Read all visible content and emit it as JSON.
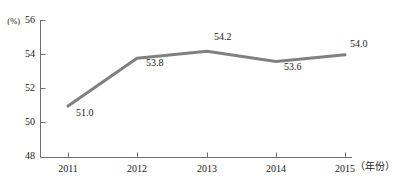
{
  "chart_data": {
    "type": "line",
    "title": "",
    "subtitle": "",
    "xlabel": "（年份）",
    "ylabel": "(%)",
    "categories": [
      "2011",
      "2012",
      "2013",
      "2014",
      "2015"
    ],
    "values": [
      51.0,
      53.8,
      54.2,
      53.6,
      54.0
    ],
    "point_labels": [
      "51.0",
      "53.8",
      "54.2",
      "53.6",
      "54.0"
    ],
    "series": [
      {
        "name": "",
        "values": [
          51.0,
          53.8,
          54.2,
          53.6,
          54.0
        ],
        "color": "#808080"
      }
    ],
    "ylim": [
      48,
      56
    ],
    "ytick_labels": [
      "56",
      "54",
      "52",
      "50",
      "48"
    ],
    "ytick_values": [
      56,
      54,
      52,
      50,
      48
    ],
    "xtick_labels": [
      "2011",
      "2012",
      "2013",
      "2014",
      "2015"
    ],
    "grid": false,
    "legend": false,
    "legend_position": "none",
    "axis_color": "#6e6e6e",
    "line_color": "#808080",
    "line_width": 3,
    "text_color": "#1a1a1a",
    "background": "#ffffff",
    "tick_direction": "in"
  },
  "axes": {
    "y_unit_label": "(%)",
    "x_unit_label": "（年份）",
    "y_ticks": [
      {
        "label": "56",
        "value": 56
      },
      {
        "label": "54",
        "value": 54
      },
      {
        "label": "52",
        "value": 52
      },
      {
        "label": "50",
        "value": 50
      },
      {
        "label": "48",
        "value": 48
      }
    ],
    "x_ticks": [
      {
        "label": "2011",
        "value": 2011
      },
      {
        "label": "2012",
        "value": 2012
      },
      {
        "label": "2013",
        "value": 2013
      },
      {
        "label": "2014",
        "value": 2014
      },
      {
        "label": "2015",
        "value": 2015
      }
    ]
  },
  "data_labels": [
    {
      "text": "51.0",
      "year": "2011"
    },
    {
      "text": "53.8",
      "year": "2012"
    },
    {
      "text": "54.2",
      "year": "2013"
    },
    {
      "text": "53.6",
      "year": "2014"
    },
    {
      "text": "54.0",
      "year": "2015"
    }
  ]
}
